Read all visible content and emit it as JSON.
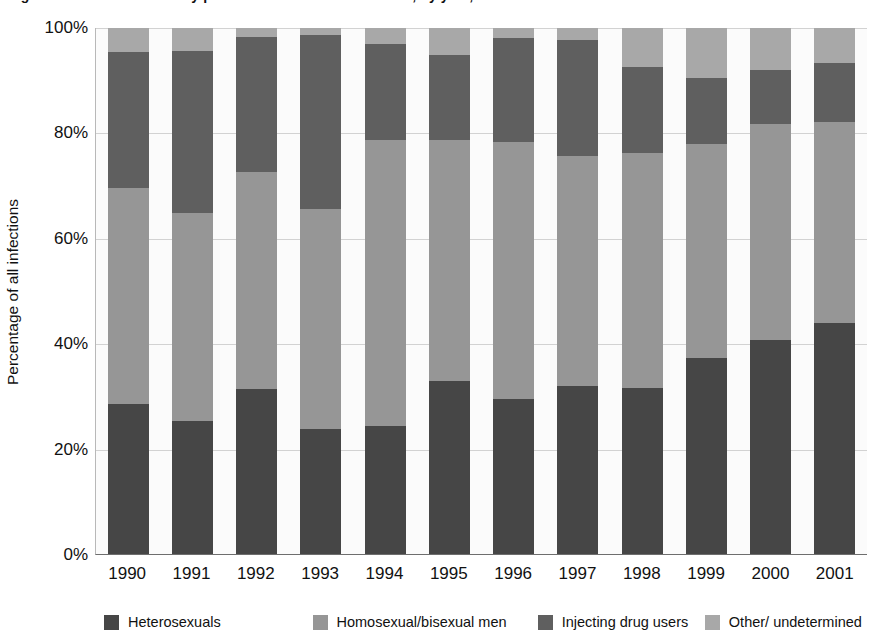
{
  "chart_data": {
    "type": "bar",
    "subtype": "stacked-bar-100-percent",
    "title": "Figure 1.1: HIV infections by probable route of transmission, by year, 1990–2001",
    "xlabel": "",
    "ylabel": "Percentage of all infections",
    "ylim": [
      0,
      100
    ],
    "ytick_labels": [
      "0%",
      "20%",
      "40%",
      "60%",
      "80%",
      "100%"
    ],
    "ytick_values": [
      0,
      20,
      40,
      60,
      80,
      100
    ],
    "grid": true,
    "legend_position": "bottom",
    "categories": [
      "1990",
      "1991",
      "1992",
      "1993",
      "1994",
      "1995",
      "1996",
      "1997",
      "1998",
      "1999",
      "2000",
      "2001"
    ],
    "series": [
      {
        "name": "Heterosexuals",
        "color": "#464646",
        "values": [
          28.5,
          25.3,
          31.4,
          23.7,
          24.4,
          32.8,
          29.5,
          32.0,
          31.6,
          37.2,
          40.7,
          44.0
        ]
      },
      {
        "name": "Homosexual/bisexual men",
        "color": "#969696",
        "values": [
          41.0,
          39.5,
          41.3,
          41.8,
          54.3,
          45.9,
          48.9,
          43.7,
          44.6,
          40.8,
          41.1,
          38.2
        ]
      },
      {
        "name": "Injecting drug users",
        "color": "#5f5f5f",
        "values": [
          25.9,
          30.8,
          25.5,
          33.2,
          18.3,
          16.1,
          19.8,
          22.0,
          16.3,
          12.5,
          10.3,
          11.2
        ]
      },
      {
        "name": "Other/ undetermined",
        "color": "#a8a8a8",
        "values": [
          4.6,
          4.4,
          1.8,
          1.3,
          3.0,
          5.2,
          1.8,
          2.3,
          7.5,
          9.5,
          7.9,
          6.6
        ]
      }
    ]
  },
  "legend": {
    "items": [
      {
        "label": "Heterosexuals",
        "color": "#464646"
      },
      {
        "label": "Homosexual/bisexual men",
        "color": "#969696"
      },
      {
        "label": "Injecting drug users",
        "color": "#5f5f5f"
      },
      {
        "label": "Other/ undetermined",
        "color": "#a8a8a8"
      }
    ]
  },
  "axes": {
    "y_title": "Percentage of all infections"
  }
}
